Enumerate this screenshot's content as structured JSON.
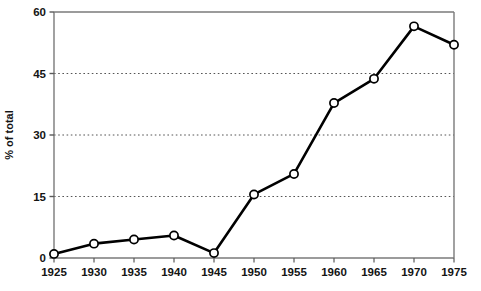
{
  "chart_data": {
    "type": "line",
    "title": "",
    "xlabel": "",
    "ylabel": "% of total",
    "x": [
      1925,
      1930,
      1935,
      1940,
      1945,
      1950,
      1955,
      1960,
      1965,
      1970,
      1975
    ],
    "xticklabels": [
      "1925",
      "1930",
      "1935",
      "1940",
      "1945",
      "1950",
      "1955",
      "1960",
      "1965",
      "1970",
      "1975"
    ],
    "values": [
      1.0,
      3.5,
      4.5,
      5.5,
      1.2,
      15.5,
      20.5,
      37.8,
      43.7,
      56.5,
      52.0
    ],
    "series": [
      {
        "name": "% of total",
        "values": [
          1.0,
          3.5,
          4.5,
          5.5,
          1.2,
          15.5,
          20.5,
          37.8,
          43.7,
          56.5,
          52.0
        ]
      }
    ],
    "ylim": [
      0,
      60
    ],
    "xlim": [
      1925,
      1975
    ],
    "yticks": [
      0,
      15,
      30,
      45,
      60
    ],
    "yticklabels": [
      "0",
      "15",
      "30",
      "45",
      "60"
    ],
    "gridlines_y": [
      15,
      30,
      45
    ],
    "grid": true,
    "grid_style": "dotted-horizontal",
    "legend": "none",
    "marker": "open-circle",
    "line_color": "#000000",
    "marker_face_color": "#ffffff",
    "marker_edge_color": "#000000",
    "axis_color": "#7a7a7a",
    "grid_color": "#555555",
    "text_color": "#141414"
  }
}
